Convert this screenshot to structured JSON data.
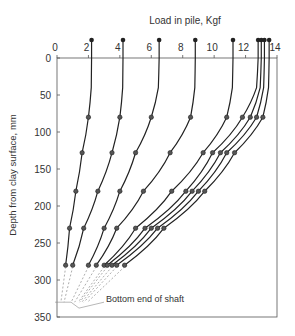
{
  "chart_data": {
    "type": "line",
    "title": "",
    "xlabel": "Load in pile,   Kgf",
    "ylabel": "Depth from clay surface,   mm",
    "xlim": [
      0,
      14
    ],
    "ylim": [
      0,
      350
    ],
    "xticks": [
      0,
      2,
      4,
      6,
      8,
      10,
      12,
      14
    ],
    "yticks": [
      0,
      50,
      100,
      150,
      200,
      250,
      300,
      350
    ],
    "grid": false,
    "annotation": "Bottom end of shaft",
    "marker_depths": [
      80,
      128,
      180,
      230,
      280
    ],
    "series": [
      {
        "name": "curve-1",
        "top": 2.2,
        "values": [
          2.0,
          1.6,
          1.2,
          0.8,
          0.55
        ]
      },
      {
        "name": "curve-2",
        "top": 4.2,
        "values": [
          4.0,
          3.5,
          2.6,
          1.7,
          1.0
        ]
      },
      {
        "name": "curve-3",
        "top": 6.5,
        "values": [
          6.0,
          5.0,
          4.0,
          3.0,
          2.0
        ]
      },
      {
        "name": "curve-4",
        "top": 8.8,
        "values": [
          8.5,
          7.2,
          5.5,
          3.8,
          2.5
        ]
      },
      {
        "name": "curve-5",
        "top": 11.2,
        "values": [
          10.8,
          9.3,
          7.3,
          5.0,
          3.0
        ]
      },
      {
        "name": "curve-6",
        "top": 12.8,
        "values": [
          11.8,
          9.9,
          8.2,
          5.6,
          3.2
        ]
      },
      {
        "name": "curve-7",
        "top": 13.0,
        "values": [
          12.3,
          10.4,
          8.6,
          6.0,
          3.5
        ]
      },
      {
        "name": "curve-8",
        "top": 13.2,
        "values": [
          12.7,
          10.8,
          9.0,
          6.4,
          3.8
        ]
      },
      {
        "name": "curve-9",
        "top": 13.5,
        "values": [
          13.1,
          11.3,
          9.4,
          6.8,
          4.3
        ]
      }
    ]
  }
}
